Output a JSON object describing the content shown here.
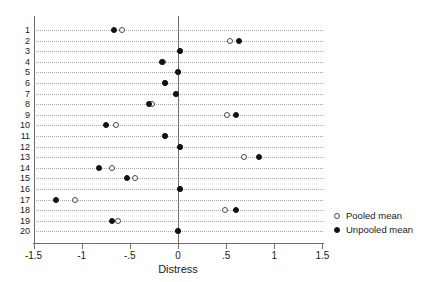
{
  "chart_data": {
    "type": "scatter",
    "title": "",
    "xlabel": "Distress",
    "ylabel": "",
    "xlim": [
      -1.75,
      1.75
    ],
    "xticks": [
      -1.5,
      -1,
      -0.5,
      0,
      0.5,
      1,
      1.5
    ],
    "xticklabels": [
      "-1.5",
      "-1",
      "-.5",
      "0",
      ".5",
      "1",
      "1.5"
    ],
    "categories": [
      "1",
      "2",
      "3",
      "4",
      "5",
      "6",
      "7",
      "8",
      "9",
      "10",
      "11",
      "12",
      "13",
      "14",
      "15",
      "16",
      "17",
      "18",
      "19",
      "20"
    ],
    "grid": "horizontal-dotted",
    "reference_line_x": 0,
    "legend_position": "right",
    "series": [
      {
        "name": "Pooled mean",
        "marker": "open-circle",
        "color": "#4a4a4a",
        "values": [
          -0.58,
          0.54,
          0.02,
          -0.16,
          0.0,
          -0.13,
          -0.02,
          -0.27,
          0.51,
          -0.64,
          -0.13,
          0.02,
          0.69,
          -0.69,
          -0.45,
          0.02,
          -1.07,
          0.49,
          -0.62,
          0.0
        ]
      },
      {
        "name": "Unpooled mean",
        "marker": "filled-circle",
        "color": "#111111",
        "values": [
          -0.66,
          0.63,
          0.02,
          -0.17,
          0.0,
          -0.14,
          -0.02,
          -0.3,
          0.6,
          -0.75,
          -0.13,
          0.02,
          0.84,
          -0.82,
          -0.53,
          0.02,
          -1.27,
          0.6,
          -0.69,
          0.0
        ]
      }
    ]
  },
  "legend": {
    "items": [
      {
        "label": "Pooled mean",
        "marker": "open-circle"
      },
      {
        "label": "Unpooled mean",
        "marker": "filled-circle"
      }
    ]
  },
  "axes": {
    "x_title": "Distress"
  }
}
